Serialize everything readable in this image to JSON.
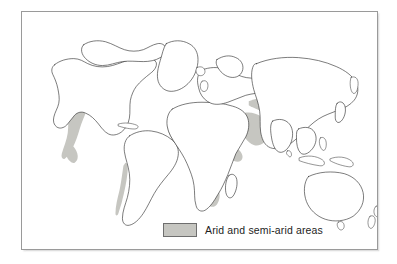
{
  "figure": {
    "kind": "world-map",
    "title": "Arid and semi-arid areas",
    "projection": "equirectangular-style world outline",
    "frame": {
      "border_color": "#9a9a9a",
      "background_color": "#ffffff"
    }
  },
  "legend": {
    "position": "bottom-center",
    "swatch_icon": "filled-square-swatch",
    "swatch_fill_color": "#c6c6c1",
    "swatch_border_color": "#6e6e6e",
    "label": "Arid and semi-arid areas"
  },
  "map": {
    "coastline_color": "#2b2b2b",
    "land_fill_color": "#ffffff",
    "arid_fill_color": "#c6c6c1",
    "continents": [
      "North America",
      "South America",
      "Greenland",
      "Europe",
      "Africa",
      "Asia",
      "Australia",
      "New Zealand"
    ],
    "arid_regions": [
      "Western United States and northern Mexico",
      "Atacama and Patagonia strip along the Andes",
      "Northeast Brazil",
      "Sahara and Sahel",
      "Horn of Africa",
      "Kalahari and Namib, southwest Africa",
      "Arabian Peninsula",
      "Iran, Central Asia and Gobi",
      "Northwest India and Pakistan",
      "Australian interior"
    ]
  }
}
